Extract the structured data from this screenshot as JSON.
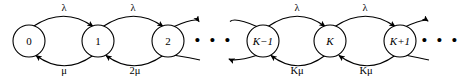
{
  "diagram": {
    "stroke_color": "#000000",
    "fill_color": "#ffffff",
    "background": "#ffffff"
  },
  "states": [
    {
      "id": "state-0",
      "label": "0",
      "cx": 29,
      "cy": 41,
      "r": 16,
      "italic": false
    },
    {
      "id": "state-1",
      "label": "1",
      "cx": 98,
      "cy": 41,
      "r": 16,
      "italic": false
    },
    {
      "id": "state-2",
      "label": "2",
      "cx": 168,
      "cy": 41,
      "r": 16,
      "italic": false
    },
    {
      "id": "state-k-1",
      "label": "K−1",
      "cx": 263,
      "cy": 41,
      "r": 16,
      "italic": true
    },
    {
      "id": "state-k",
      "label": "K",
      "cx": 330,
      "cy": 41,
      "r": 16,
      "italic": true
    },
    {
      "id": "state-k+1",
      "label": "K+1",
      "cx": 400,
      "cy": 41,
      "r": 16,
      "italic": true
    }
  ],
  "forward_rates": [
    {
      "id": "rate-lambda-0-1",
      "label": "λ",
      "x": 64,
      "y": 9
    },
    {
      "id": "rate-lambda-1-2",
      "label": "λ",
      "x": 133,
      "y": 9
    },
    {
      "id": "rate-lambda-k1-k",
      "label": "λ",
      "x": 297,
      "y": 9
    },
    {
      "id": "rate-lambda-k-k1",
      "label": "λ",
      "x": 365,
      "y": 9
    }
  ],
  "backward_rates": [
    {
      "id": "rate-mu-1-0",
      "label": "μ",
      "prefix": "",
      "italic_prefix": "",
      "x": 64,
      "y": 72
    },
    {
      "id": "rate-2mu-2-1",
      "label": "2μ",
      "prefix": "2",
      "italic_prefix": "",
      "x": 135,
      "y": 72
    },
    {
      "id": "rate-kmu-k-k1",
      "label": "Kμ",
      "prefix": "",
      "italic_prefix": "K",
      "x": 297,
      "y": 72
    },
    {
      "id": "rate-kmu-k1-k",
      "label": "Kμ",
      "prefix": "",
      "italic_prefix": "K",
      "x": 366,
      "y": 72
    }
  ],
  "ellipses": [
    {
      "id": "ellipsis-middle",
      "label": "• • •",
      "x": 214,
      "y": 41
    },
    {
      "id": "ellipsis-right",
      "label": "• • •",
      "x": 440,
      "y": 41
    }
  ]
}
